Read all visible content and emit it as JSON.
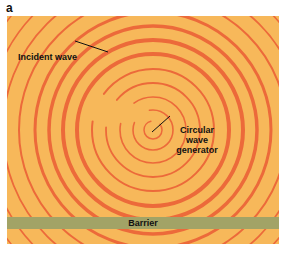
{
  "figure": {
    "panel_letter": "a",
    "labels": {
      "incident_wave": "Incident wave",
      "generator_line1": "Circular",
      "generator_line2": "wave",
      "generator_line3": "generator",
      "barrier": "Barrier"
    },
    "colors": {
      "background": "#f7b85a",
      "wave": "#ec6a3a",
      "barrier": "#a2a366",
      "text": "#111111"
    },
    "wave_center": [
      146,
      114
    ]
  }
}
